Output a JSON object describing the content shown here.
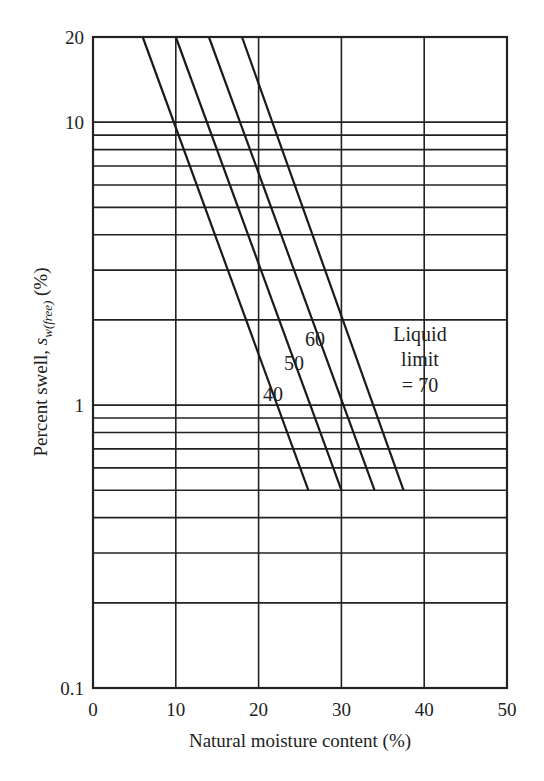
{
  "chart_data": {
    "type": "line",
    "title": "",
    "xlabel": "Natural moisture content (%)",
    "ylabel": "Percent swell, s_w(free) (%)",
    "ylabel_main": "Percent swell, ",
    "ylabel_symbol": "s",
    "ylabel_subscript": "w(free)",
    "ylabel_unit": " (%)",
    "xlim": [
      0,
      50
    ],
    "ylim": [
      0.1,
      20
    ],
    "yscale": "log",
    "grid": true,
    "x_ticks": [
      0,
      10,
      20,
      30,
      40,
      50
    ],
    "x_tick_labels": [
      "0",
      "10",
      "20",
      "30",
      "40",
      "50"
    ],
    "y_ticks": [
      0.1,
      1,
      10,
      20
    ],
    "y_tick_labels": [
      "0.1",
      "1",
      "10",
      "20"
    ],
    "y_minor_gridlines": [
      0.2,
      0.3,
      0.4,
      0.5,
      0.6,
      0.7,
      0.8,
      0.9,
      2,
      3,
      4,
      5,
      6,
      7,
      8,
      9
    ],
    "series": [
      {
        "name": "Liquid limit = 40",
        "label": "40",
        "x": [
          6,
          26
        ],
        "y": [
          20,
          0.5
        ]
      },
      {
        "name": "Liquid limit = 50",
        "label": "50",
        "x": [
          10,
          30
        ],
        "y": [
          20,
          0.5
        ]
      },
      {
        "name": "Liquid limit = 60",
        "label": "60",
        "x": [
          14,
          34
        ],
        "y": [
          20,
          0.5
        ]
      },
      {
        "name": "Liquid limit = 70",
        "label": "70",
        "x": [
          18,
          37.5
        ],
        "y": [
          20,
          0.5
        ]
      }
    ],
    "annotations": {
      "legend_line1": "Liquid",
      "legend_line2": "limit",
      "legend_line3": "= 70"
    }
  }
}
